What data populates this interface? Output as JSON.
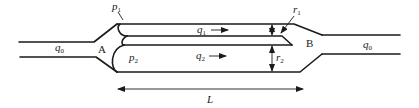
{
  "figure": {
    "type": "pipe-network-schematic",
    "nodes": [
      {
        "id": "A",
        "label": "A"
      },
      {
        "id": "B",
        "label": "B"
      }
    ],
    "inlet_flow": {
      "symbol": "q",
      "subscript": "0"
    },
    "outlet_flow": {
      "symbol": "q",
      "subscript": "0"
    },
    "branches": [
      {
        "flow": {
          "symbol": "q",
          "subscript": "1"
        },
        "pressure": {
          "symbol": "p",
          "subscript": "1"
        },
        "radius": {
          "symbol": "r",
          "subscript": "1"
        }
      },
      {
        "flow": {
          "symbol": "q",
          "subscript": "2"
        },
        "pressure": {
          "symbol": "p",
          "subscript": "2"
        },
        "radius": {
          "symbol": "r",
          "subscript": "2"
        }
      }
    ],
    "length": {
      "symbol": "L"
    },
    "colors": {
      "stroke": "#1a1a1a",
      "background": "#ffffff"
    }
  }
}
